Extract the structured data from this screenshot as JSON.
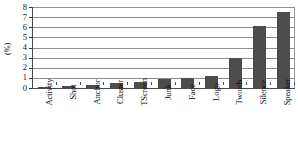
{
  "chart_data": {
    "type": "bar",
    "title": "",
    "subtitle": "",
    "xlabel": "",
    "ylabel": "(%)",
    "ylim": [
      0,
      8
    ],
    "yticks": [
      0,
      1,
      2,
      3,
      4,
      5,
      6,
      7,
      8
    ],
    "ytick_labels": [
      "0",
      "1",
      "2",
      "3",
      "4",
      "5",
      "6",
      "7",
      "8"
    ],
    "grid": true,
    "grid_axis": "y",
    "legend": false,
    "legend_position": "none",
    "categories": [
      "Activity",
      "Shot",
      "Anchor",
      "Cluster",
      "TScreen",
      "Junk",
      "Face",
      "Logo",
      "Twords",
      "Silence",
      "Speaker"
    ],
    "values": [
      0.07,
      0.15,
      0.3,
      0.5,
      0.6,
      0.9,
      1.0,
      1.2,
      3.0,
      6.1,
      7.5
    ],
    "series": [
      {
        "name": "percentage",
        "values": [
          0.07,
          0.15,
          0.3,
          0.5,
          0.6,
          0.9,
          1.0,
          1.2,
          3.0,
          6.1,
          7.5
        ]
      }
    ],
    "bar_color": "#4d4d4d",
    "axis_color": "#4a4a4a",
    "gridline_color": "#8d8d8d",
    "background_color": "#ffffff"
  }
}
